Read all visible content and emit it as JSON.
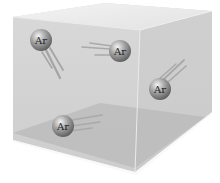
{
  "diagram": {
    "container": {
      "description": "transparent box",
      "colors": {
        "top_face": "#e6e6e6",
        "back_face": "#d2d2d2",
        "side_face": "#cccccc",
        "floor": "#bdbdbd",
        "edge": "#f2f2f2"
      }
    },
    "atoms": [
      {
        "label": "Ar",
        "cx": 41,
        "cy": 40,
        "trail_direction": "down-right"
      },
      {
        "label": "Ar",
        "cx": 120,
        "cy": 51,
        "trail_direction": "left"
      },
      {
        "label": "Ar",
        "cx": 160,
        "cy": 89,
        "trail_direction": "up-right"
      },
      {
        "label": "Ar",
        "cx": 63,
        "cy": 126,
        "trail_direction": "right"
      }
    ],
    "atom_color": "#8a8a8a"
  }
}
